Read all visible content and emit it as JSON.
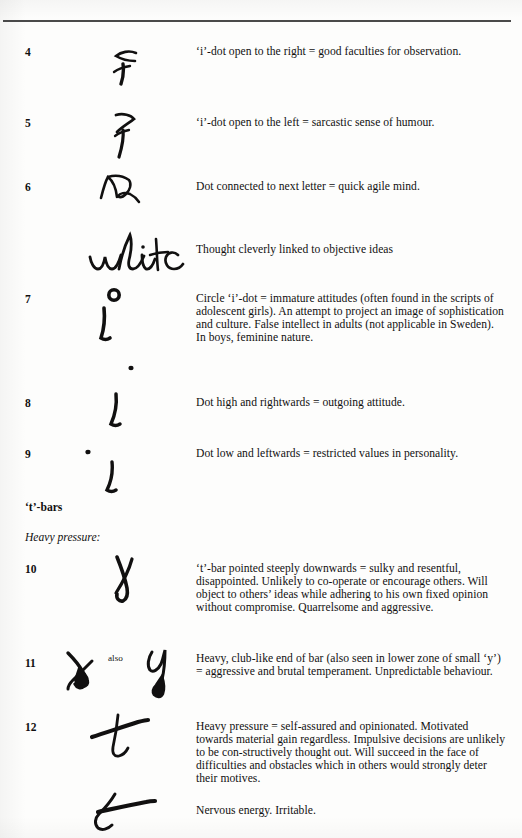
{
  "page": {
    "background_color": "#fdfdfc",
    "ink_color": "#111010",
    "rule_color": "#4a4a4a",
    "width": 522,
    "height": 838
  },
  "headings": {
    "t_bars": "‘t’-bars",
    "heavy_pressure": "Heavy pressure:"
  },
  "entries": [
    {
      "number": "4",
      "specimen_name": "i-dot-open-right-specimen",
      "description": "‘i’-dot open to the right = good faculties for observation."
    },
    {
      "number": "5",
      "specimen_name": "i-dot-open-left-specimen",
      "description": "‘i’-dot open to the left = sarcastic sense of humour."
    },
    {
      "number": "6",
      "specimen_name": "dot-connected-next-letter-specimen",
      "description": "Dot connected to next letter = quick agile mind."
    },
    {
      "number": "",
      "specimen_name": "white-word-specimen",
      "description": "Thought cleverly linked to objective ideas"
    },
    {
      "number": "7",
      "specimen_name": "circle-i-dot-specimen",
      "description": "Circle ‘i’-dot = immature attitudes (often found in the scripts of adolescent girls). An attempt to project an image of sophistication and culture. False intellect in adults (not applicable in Sweden). In boys, feminine nature."
    },
    {
      "number": "8",
      "specimen_name": "dot-high-rightwards-specimen",
      "description": "Dot high and rightwards = outgoing attitude."
    },
    {
      "number": "9",
      "specimen_name": "dot-low-leftwards-specimen",
      "description": "Dot low and leftwards = restricted values in personality."
    },
    {
      "number": "10",
      "specimen_name": "t-bar-pointed-downwards-specimen",
      "description": "‘t’-bar pointed steeply downwards = sulky and resentful, disappointed. Unlikely to co-operate or encourage others. Will object to others’ ideas while adhering to his own fixed opinion without compromise. Quarrelsome and aggressive."
    },
    {
      "number": "11",
      "specimen_name": "club-like-bar-specimen",
      "connector_label": "also",
      "description": "Heavy, club-like end of bar (also seen in lower zone of small ‘y’) = aggressive and brutal temperament. Unpredictable behaviour."
    },
    {
      "number": "12",
      "specimen_name": "heavy-pressure-t-specimen",
      "description": "Heavy pressure = self-assured and opinionated. Motivated towards material gain regardless. Impulsive decisions are unlikely to be con-structively thought out. Will succeed in the face of difficulties and obstacles which in others would strongly deter their motives."
    },
    {
      "number": "",
      "specimen_name": "nervous-energy-t-specimen",
      "description": "Nervous energy. Irritable."
    }
  ]
}
